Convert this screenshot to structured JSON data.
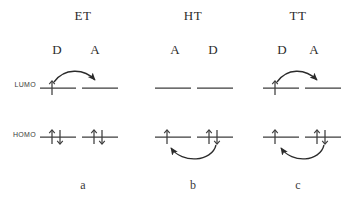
{
  "figure": {
    "type": "energy-level-diagram",
    "caption_row": [
      "a",
      "b",
      "c"
    ],
    "orbital_labels": {
      "lumo": "LUMO",
      "homo": "HOMO"
    },
    "line_color": "#3d3d3d",
    "text_color": "#2b2b2b",
    "background": "#ffffff",
    "panels": [
      {
        "id": "a",
        "title": "ET",
        "caption": "a",
        "left_label": "D",
        "right_label": "A",
        "lumo": {
          "left_occupancy": "up",
          "right_occupancy": "empty"
        },
        "homo": {
          "left_occupancy": "up-down",
          "right_occupancy": "up-down"
        },
        "transfer_arrow": {
          "level": "lumo",
          "from": "left",
          "to": "right"
        }
      },
      {
        "id": "b",
        "title": "HT",
        "caption": "b",
        "left_label": "A",
        "right_label": "D",
        "lumo": {
          "left_occupancy": "empty",
          "right_occupancy": "empty"
        },
        "homo": {
          "left_occupancy": "up",
          "right_occupancy": "up-down"
        },
        "transfer_arrow": {
          "level": "homo",
          "from": "right",
          "to": "left"
        }
      },
      {
        "id": "c",
        "title": "TT",
        "caption": "c",
        "left_label": "D",
        "right_label": "A",
        "lumo": {
          "left_occupancy": "up",
          "right_occupancy": "empty"
        },
        "homo": {
          "left_occupancy": "up",
          "right_occupancy": "up-down"
        },
        "transfer_arrow_lumo": {
          "level": "lumo",
          "from": "left",
          "to": "right"
        },
        "transfer_arrow_homo": {
          "level": "homo",
          "from": "right",
          "to": "left"
        }
      }
    ]
  }
}
